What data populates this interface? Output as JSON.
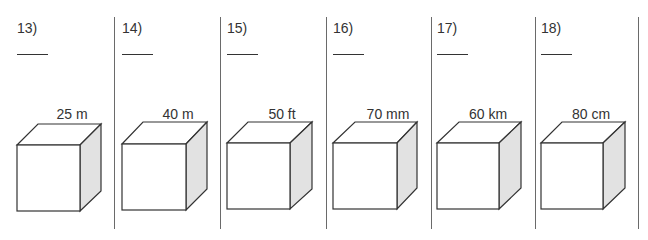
{
  "worksheet": {
    "problems": [
      {
        "number": "13)",
        "edge_label": "25 m"
      },
      {
        "number": "14)",
        "edge_label": "40 m"
      },
      {
        "number": "15)",
        "edge_label": "50 ft"
      },
      {
        "number": "16)",
        "edge_label": "70 mm"
      },
      {
        "number": "17)",
        "edge_label": "60 km"
      },
      {
        "number": "18)",
        "edge_label": "80 cm"
      }
    ],
    "colors": {
      "stroke": "#333333",
      "side_fill": "#e2e2e2",
      "divider": "#6a6a6a"
    }
  }
}
